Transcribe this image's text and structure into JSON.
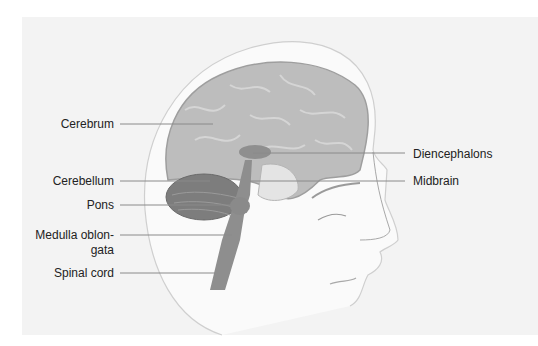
{
  "diagram": {
    "labels_left": [
      {
        "id": "cerebrum",
        "text": "Cerebrum"
      },
      {
        "id": "cerebellum",
        "text": "Cerebellum"
      },
      {
        "id": "pons",
        "text": "Pons"
      },
      {
        "id": "medulla",
        "text": "Medulla oblon-",
        "text2": "gata"
      },
      {
        "id": "spinal-cord",
        "text": "Spinal cord"
      }
    ],
    "labels_right": [
      {
        "id": "diencephalons",
        "text": "Diencephalons"
      },
      {
        "id": "midbrain",
        "text": "Midbrain"
      }
    ],
    "colors": {
      "background_panel": "#f3f3f3",
      "cerebrum": "#b9b9b9",
      "cerebellum": "#7a7a7a",
      "brainstem": "#8e8e8e",
      "leader_line": "#8a8a8a",
      "label_text": "#222222"
    }
  }
}
